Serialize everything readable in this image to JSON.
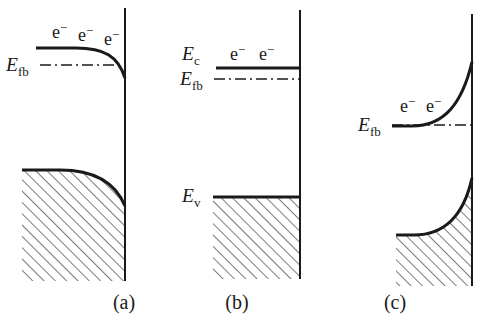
{
  "figure": {
    "background_color": "#ffffff",
    "line_color": "#1a1a1a",
    "panel_count": 3
  },
  "panels": [
    {
      "id": "panel-a",
      "caption": "(a)",
      "caption_x": 124,
      "caption_y": 309,
      "condition": "downward band bending (accumulation)",
      "interface": {
        "x": 125,
        "y_top": 8,
        "y_bottom": 281
      },
      "conduction_band": {
        "label": "",
        "flat_level_y": 48,
        "bend_direction": "down",
        "path": "M 36 48 L 76 48 C 104 48 118 56 125 78"
      },
      "valence_band": {
        "label": "",
        "flat_level_y": 170,
        "bend_direction": "down",
        "path": "M 22 170 L 60 170 C 96 170 116 184 125 206"
      },
      "fermi_level": {
        "label": "E",
        "sublabel": "fb",
        "label_x": 6,
        "label_y": 71,
        "line_y": 65,
        "line_x_start": 40,
        "line_x_end": 126
      },
      "electron_labels": [
        {
          "text": "e",
          "sup": "−",
          "x": 52,
          "y": 38
        },
        {
          "text": "e",
          "sup": "−",
          "x": 78,
          "y": 41
        },
        {
          "text": "e",
          "sup": "−",
          "x": 104,
          "y": 45
        }
      ],
      "hatch_region_path": "M 22 170 L 60 170 C 96 170 116 184 125 206 L 125 281 L 22 281 Z"
    },
    {
      "id": "panel-b",
      "caption": "(b)",
      "caption_x": 237,
      "caption_y": 309,
      "condition": "flat band condition",
      "interface": {
        "x": 300,
        "y_top": 10,
        "y_bottom": 279
      },
      "conduction_band": {
        "label": "E",
        "sublabel": "c",
        "label_x": 182,
        "label_y": 60,
        "flat_level_y": 68,
        "bend_direction": "none",
        "path": "M 216 68 L 300 68"
      },
      "valence_band": {
        "label": "E",
        "sublabel": "v",
        "label_x": 182,
        "label_y": 202,
        "flat_level_y": 197,
        "bend_direction": "none",
        "path": "M 213 197 L 300 197"
      },
      "fermi_level": {
        "label": "E",
        "sublabel": "fb",
        "label_x": 180,
        "label_y": 85,
        "line_y": 79,
        "line_x_start": 214,
        "line_x_end": 301
      },
      "electron_labels": [
        {
          "text": "e",
          "sup": "−",
          "x": 230,
          "y": 60
        },
        {
          "text": "e",
          "sup": "−",
          "x": 259,
          "y": 60
        }
      ],
      "hatch_region_path": "M 213 197 L 300 197 L 300 279 L 213 279 Z"
    },
    {
      "id": "panel-c",
      "caption": "(c)",
      "caption_x": 395,
      "caption_y": 309,
      "condition": "upward band bending (depletion)",
      "interface": {
        "x": 472,
        "y_top": 14,
        "y_bottom": 286
      },
      "conduction_band": {
        "label": "",
        "flat_level_y": 126,
        "bend_direction": "up",
        "path": "M 392 126 L 412 126 C 444 126 462 104 472 62"
      },
      "valence_band": {
        "label": "",
        "flat_level_y": 235,
        "bend_direction": "up",
        "path": "M 396 235 L 414 235 C 446 235 464 214 472 178"
      },
      "fermi_level": {
        "label": "E",
        "sublabel": "fb",
        "label_x": 358,
        "label_y": 131,
        "line_y": 125,
        "line_x_start": 392,
        "line_x_end": 473
      },
      "electron_labels": [
        {
          "text": "e",
          "sup": "−",
          "x": 400,
          "y": 112
        },
        {
          "text": "e",
          "sup": "−",
          "x": 426,
          "y": 112
        }
      ],
      "hatch_region_path": "M 396 235 L 414 235 C 446 235 464 214 472 178 L 472 286 L 396 286 Z"
    }
  ]
}
